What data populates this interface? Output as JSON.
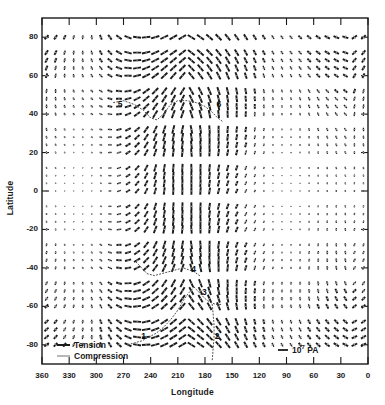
{
  "figure": {
    "type": "vector-field-map",
    "xlabel": "Longitude",
    "ylabel": "Latitude"
  },
  "axes": {
    "x": {
      "label": "Longitude",
      "ticks": [
        "360",
        "330",
        "300",
        "270",
        "240",
        "210",
        "180",
        "150",
        "120",
        "90",
        "60",
        "30",
        "0"
      ],
      "min": 0,
      "max": 360,
      "reversed": true
    },
    "y": {
      "label": "Latitude",
      "ticks": [
        "80",
        "60",
        "40",
        "20",
        "0",
        "-20",
        "-40",
        "-60",
        "-80"
      ],
      "min": -90,
      "max": 90
    }
  },
  "legend": {
    "tension_label": "Tension",
    "compression_label": "Compression",
    "scale_value": "10",
    "scale_exponent": "7",
    "scale_unit": "PA"
  },
  "annotations": [
    {
      "label": "1",
      "lon": 247,
      "lat": -76
    },
    {
      "label": "2",
      "lon": 166,
      "lat": -76
    },
    {
      "label": "3",
      "lon": 180,
      "lat": -53
    },
    {
      "label": "4",
      "lon": 192,
      "lat": -41
    },
    {
      "label": "5",
      "lon": 273,
      "lat": 45
    },
    {
      "label": "6",
      "lon": 164,
      "lat": 45
    }
  ],
  "colors": {
    "tension": "#1a1a1a",
    "compression": "#9a9a9a",
    "axis": "#1a1a1a",
    "background": "#ffffff",
    "boundary": "#555555"
  },
  "chart_data": {
    "type": "scatter",
    "title": "",
    "xlabel": "Longitude",
    "ylabel": "Latitude",
    "xlim": [
      360,
      0
    ],
    "ylim": [
      -90,
      90
    ],
    "grid": false,
    "legend_position": "bottom-inside",
    "series": [
      {
        "name": "Tension",
        "style": "solid-dark-segment"
      },
      {
        "name": "Compression",
        "style": "light-gray-segment"
      }
    ],
    "field_grid": {
      "lon_start": 355,
      "lon_step": -10,
      "lon_count": 36,
      "lat_values": [
        80,
        72,
        68,
        64,
        60,
        52,
        48,
        44,
        40,
        32,
        28,
        24,
        20,
        12,
        8,
        4,
        0,
        -8,
        -12,
        -16,
        -20,
        -28,
        -32,
        -36,
        -40,
        -48,
        -52,
        -56,
        -60,
        -68,
        -72,
        -76,
        -80
      ]
    }
  }
}
